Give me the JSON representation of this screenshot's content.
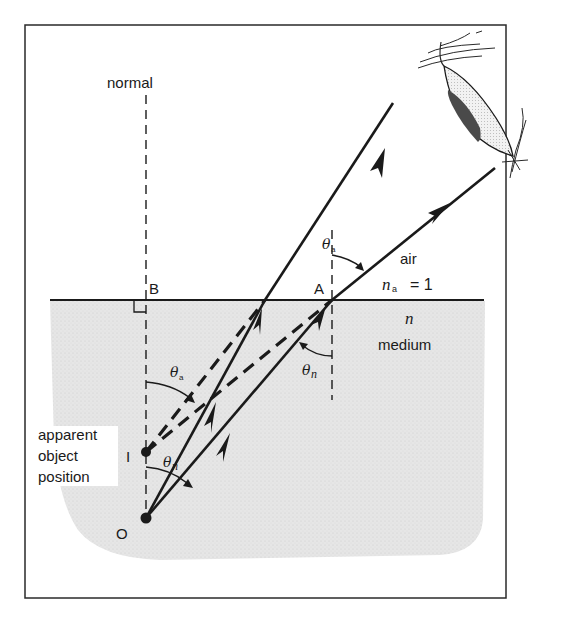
{
  "figure": {
    "labels": {
      "normal": "normal",
      "point_b": "B",
      "point_a": "A",
      "point_i": "I",
      "point_o": "O",
      "air": "air",
      "n_a_symbol": "n",
      "n_a_subscript": "a",
      "n_a_value": "= 1",
      "n_medium_symbol": "n",
      "medium": "medium",
      "apparent_line1": "apparent",
      "apparent_line2": "object",
      "apparent_line3": "position",
      "theta": "θ",
      "sub_a": "a",
      "sub_n": "n"
    },
    "colors": {
      "ink": "#1a1a1a",
      "medium_fill": "#e4e4e4",
      "frame": "#2a2a2a",
      "eye_fill": "#ededed",
      "iris": "#555555"
    }
  }
}
